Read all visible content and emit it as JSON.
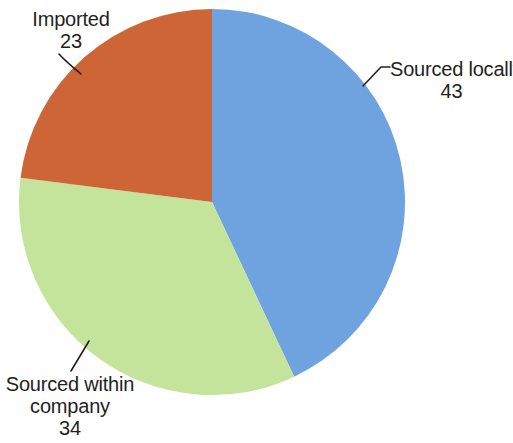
{
  "chart_data": {
    "type": "pie",
    "title": "",
    "categories": [
      "Sourced locally",
      "Sourced within company",
      "Imported"
    ],
    "values": [
      43,
      34,
      23
    ],
    "unit": "",
    "total": 100,
    "start_angle_deg": 0,
    "direction": "clockwise",
    "legend": "none",
    "labels_position": "outside-with-leader-lines",
    "slices": [
      {
        "label": "Sourced locally",
        "value": 43,
        "color": "#6fa3e0",
        "start_deg": 0,
        "end_deg": 154.8
      },
      {
        "label": "Sourced within company",
        "value": 34,
        "color": "#c4e39b",
        "start_deg": 154.8,
        "end_deg": 277.2
      },
      {
        "label": "Imported",
        "value": 23,
        "color": "#cd6536",
        "start_deg": 277.2,
        "end_deg": 360
      }
    ]
  },
  "callouts": {
    "imported": {
      "title": "Imported",
      "value": "23"
    },
    "sourced_locally": {
      "title": "Sourced locally",
      "value": "43"
    },
    "sourced_within": {
      "title_line1": "Sourced within",
      "title_line2": "company",
      "value": "34"
    }
  },
  "colors": {
    "blue": "#6fa3e0",
    "green": "#c4e39b",
    "orange": "#cd6536",
    "text": "#231f20",
    "leader_line": "#231f20",
    "background": "#ffffff"
  }
}
